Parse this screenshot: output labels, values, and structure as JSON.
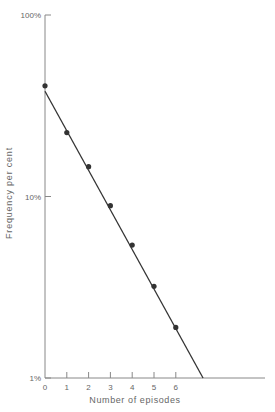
{
  "chart_data": {
    "type": "scatter",
    "title": "",
    "xlabel": "Number of episodes",
    "ylabel": "Frequency per cent",
    "yscale": "log",
    "ylim": [
      1,
      100
    ],
    "xlim": [
      0,
      10
    ],
    "y_ticks": [
      {
        "value": 100,
        "label": "100%"
      },
      {
        "value": 10,
        "label": "10%"
      },
      {
        "value": 1,
        "label": "1%"
      }
    ],
    "x_ticks": [
      {
        "value": 0,
        "label": "0"
      },
      {
        "value": 1,
        "label": "1"
      },
      {
        "value": 2,
        "label": "2"
      },
      {
        "value": 3,
        "label": "3"
      },
      {
        "value": 4,
        "label": "4"
      },
      {
        "value": 5,
        "label": "5"
      },
      {
        "value": 6,
        "label": "6"
      }
    ],
    "series": [
      {
        "name": "Observed",
        "type": "scatter",
        "x": [
          0,
          1,
          2,
          3,
          4,
          5,
          6
        ],
        "values": [
          40.7,
          22.5,
          14.6,
          8.9,
          5.4,
          3.2,
          1.9
        ]
      },
      {
        "name": "Fitted line",
        "type": "line",
        "x": [
          0,
          7.25
        ],
        "values": [
          38,
          1
        ]
      }
    ],
    "grid": false,
    "legend": null
  },
  "colors": {
    "axis": "#888888",
    "line": "#333333",
    "point": "#333333",
    "text": "#666666"
  }
}
